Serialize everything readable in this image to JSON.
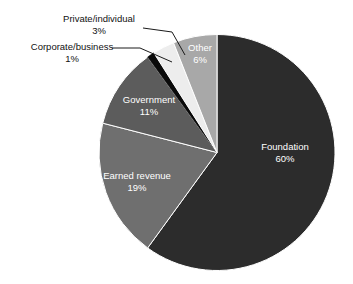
{
  "chart_data": {
    "type": "pie",
    "title": "",
    "subtitle": "",
    "xlabel": "",
    "ylabel": "",
    "grid": false,
    "legend": "none",
    "value_unit": "%",
    "start_angle_deg": 0,
    "direction": "clockwise",
    "categories": [
      "Foundation",
      "Earned revenue",
      "Government",
      "Corporate/business",
      "Private/individual",
      "Other"
    ],
    "values": [
      60,
      19,
      11,
      1,
      3,
      6
    ],
    "slices": [
      {
        "name": "Foundation",
        "label": "Foundation",
        "value": 60,
        "value_text": "60%",
        "color": "#2c2c2c",
        "label_placement": "inside",
        "label_color": "#ffffff"
      },
      {
        "name": "Earned revenue",
        "label": "Earned revenue",
        "value": 19,
        "value_text": "19%",
        "color": "#6f6f6f",
        "label_placement": "inside",
        "label_color": "#ffffff"
      },
      {
        "name": "Government",
        "label": "Government",
        "value": 11,
        "value_text": "11%",
        "color": "#5c5c5c",
        "label_placement": "inside",
        "label_color": "#ffffff"
      },
      {
        "name": "Corporate/business",
        "label": "Corporate/business",
        "value": 1,
        "value_text": "1%",
        "color": "#0a0a0a",
        "label_placement": "callout",
        "label_color": "#111111"
      },
      {
        "name": "Private/individual",
        "label": "Private/individual",
        "value": 3,
        "value_text": "3%",
        "color": "#ededed",
        "label_placement": "callout",
        "label_color": "#111111"
      },
      {
        "name": "Other",
        "label": "Other",
        "value": 6,
        "value_text": "6%",
        "color": "#a8a8a8",
        "label_placement": "inside",
        "label_color": "#ffffff"
      }
    ],
    "colors": {
      "foundation": "#2c2c2c",
      "earned_revenue": "#6f6f6f",
      "government": "#5c5c5c",
      "corporate_business": "#0a0a0a",
      "private_individual": "#ededed",
      "other": "#a8a8a8",
      "background": "#ffffff",
      "slice_outline": "#ffffff",
      "leader_line": "#1a1a1a",
      "inside_label_text": "#ffffff",
      "callout_label_text": "#111111"
    }
  }
}
